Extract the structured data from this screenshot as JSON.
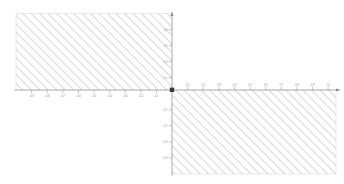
{
  "figure": {
    "title": "",
    "background_color": "#ffffff",
    "width": 344,
    "height": 184
  },
  "axes": {
    "origin_px": {
      "x": 172,
      "y": 90
    },
    "axis_color": "#8c8c8c",
    "x_axis": {
      "label": "",
      "start_px": 14,
      "end_px": 340,
      "tick_direction_left": "down",
      "tick_direction_right": "up"
    },
    "y_axis": {
      "label": "",
      "start_px": 12,
      "end_px": 176,
      "tick_direction": "left"
    }
  },
  "chart_data": {
    "type": "area",
    "title": "",
    "xlabel": "",
    "ylabel": "",
    "grid": false,
    "legend": null,
    "xlim": [
      -1.0,
      1.05
    ],
    "ylim": [
      -0.5,
      0.5
    ],
    "x_ticks": [
      -0.9,
      -0.8,
      -0.7,
      -0.6,
      -0.5,
      -0.4,
      -0.3,
      -0.2,
      -0.1,
      0.1,
      0.2,
      0.3,
      0.4,
      0.5,
      0.6,
      0.7,
      0.8,
      0.9,
      1.0
    ],
    "x_tick_labels": [
      "-0.9",
      "-0.8",
      "-0.7",
      "-0.6",
      "-0.5",
      "-0.4",
      "-0.3",
      "-0.2",
      "-0.1",
      "0.1",
      "0.2",
      "0.3",
      "0.4",
      "0.5",
      "0.6",
      "0.7",
      "0.8",
      "0.9",
      "1.0"
    ],
    "y_ticks": [
      0.4,
      0.3,
      0.2,
      0.1,
      -0.1,
      -0.2,
      -0.3,
      -0.4
    ],
    "y_tick_labels": [
      "0.4",
      "0.3",
      "0.2",
      "0.1",
      "-0.1",
      "-0.2",
      "-0.3",
      "-0.4"
    ],
    "regions": [
      {
        "name": "second-quadrant-region",
        "quadrant": "II",
        "x_range": [
          -1.0,
          0.0
        ],
        "y_range": [
          0.0,
          0.45
        ],
        "fill": "hatch",
        "hatch_pattern": "diagonal-forward-slash",
        "hatch_color": "#bdbdbd",
        "edge_color": "#c9c9c9"
      },
      {
        "name": "fourth-quadrant-region",
        "quadrant": "IV",
        "x_range": [
          0.0,
          1.02
        ],
        "y_range": [
          -0.49,
          0.0
        ],
        "fill": "hatch",
        "hatch_pattern": "diagonal-forward-slash",
        "hatch_color": "#bdbdbd",
        "edge_color": "#c9c9c9"
      }
    ],
    "markers": [
      {
        "name": "origin-point",
        "x": 0.0,
        "y": 0.0,
        "shape": "square",
        "color": "#3a3a3a"
      }
    ]
  }
}
